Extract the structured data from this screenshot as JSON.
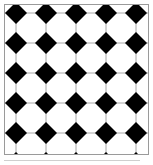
{
  "colors": {
    "diamond": "#000000",
    "octagon": "#ffffff",
    "grout_line": "#a8a8a8",
    "frame": "#9a9a9a",
    "background": "#ffffff",
    "edge_sliver": "#cfcfcf"
  },
  "pattern": {
    "name": "octagon-diamond-tiling",
    "lattice_pitch_px": 30,
    "diamond_half_diagonal_px": 11,
    "grout_line_width_px": 1,
    "origin_x_px": 16,
    "origin_y_px": 13,
    "columns": 5,
    "rows": 6,
    "diamond_centers": [
      {
        "x": 16,
        "y": 13
      },
      {
        "x": 46,
        "y": 13
      },
      {
        "x": 76,
        "y": 13
      },
      {
        "x": 106,
        "y": 13
      },
      {
        "x": 136,
        "y": 13
      },
      {
        "x": 16,
        "y": 43
      },
      {
        "x": 46,
        "y": 43
      },
      {
        "x": 76,
        "y": 43
      },
      {
        "x": 106,
        "y": 43
      },
      {
        "x": 136,
        "y": 43
      },
      {
        "x": 16,
        "y": 73
      },
      {
        "x": 46,
        "y": 73
      },
      {
        "x": 76,
        "y": 73
      },
      {
        "x": 106,
        "y": 73
      },
      {
        "x": 136,
        "y": 73
      },
      {
        "x": 16,
        "y": 103
      },
      {
        "x": 46,
        "y": 103
      },
      {
        "x": 76,
        "y": 103
      },
      {
        "x": 106,
        "y": 103
      },
      {
        "x": 136,
        "y": 103
      },
      {
        "x": 16,
        "y": 133
      },
      {
        "x": 46,
        "y": 133
      },
      {
        "x": 76,
        "y": 133
      },
      {
        "x": 106,
        "y": 133
      },
      {
        "x": 136,
        "y": 133
      },
      {
        "x": 16,
        "y": 163
      },
      {
        "x": 46,
        "y": 163
      },
      {
        "x": 76,
        "y": 163
      },
      {
        "x": 106,
        "y": 163
      },
      {
        "x": 136,
        "y": 163
      }
    ],
    "grout_lines_vertical_x": [
      16,
      46,
      76,
      106,
      136
    ],
    "grout_lines_horizontal_y": [
      13,
      43,
      73,
      103,
      133,
      163
    ]
  },
  "frame": {
    "left_px": 4,
    "top_px": 4,
    "width_px": 145,
    "height_px": 151,
    "border_width_px": 1
  },
  "canvas": {
    "width_px": 153,
    "height_px": 165
  }
}
